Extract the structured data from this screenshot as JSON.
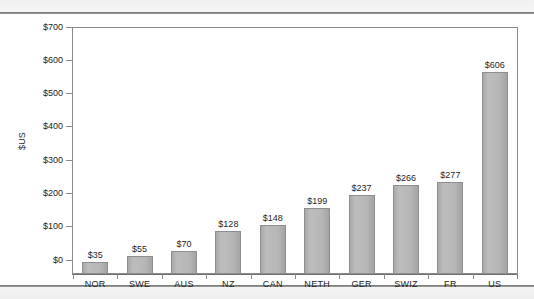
{
  "chart_data": {
    "type": "bar",
    "title": "",
    "subtitle": "",
    "xlabel": "",
    "ylabel": "$US",
    "categories": [
      "NOR",
      "SWE",
      "AUS",
      "NZ",
      "CAN",
      "NETH",
      "GER",
      "SWIZ",
      "FR",
      "US"
    ],
    "values": [
      35,
      55,
      70,
      128,
      148,
      199,
      237,
      266,
      277,
      606
    ],
    "data_labels": [
      "$35",
      "$55",
      "$70",
      "$128",
      "$148",
      "$199",
      "$237",
      "$266",
      "$277",
      "$606"
    ],
    "ylim": [
      0,
      700
    ],
    "y_ticks": [
      0,
      100,
      200,
      300,
      400,
      500,
      600,
      700
    ],
    "y_tick_labels": [
      "$0",
      "$100",
      "$200",
      "$300",
      "$400",
      "$500",
      "$600",
      "$700"
    ],
    "grid": false,
    "legend": false,
    "legend_position": "none",
    "bar_color": "#b4b4b4",
    "bar_border_color": "#8e8e8e",
    "axis_color": "#8a8a8a",
    "text_color": "#1f1f1f",
    "plot_background": "#ffffff",
    "page_background": "#fbfbfb"
  }
}
